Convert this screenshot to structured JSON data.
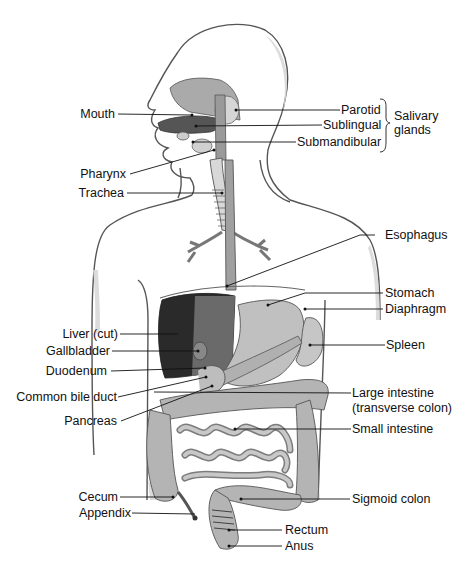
{
  "figure": {
    "type": "anatomical-diagram",
    "colors": {
      "body_outline": "#555555",
      "body_shadow": "#d4d4d4",
      "organ_fill": "#a9a9a9",
      "organ_light": "#c4c4c4",
      "organ_dark": "#6e6e6e",
      "liver_dark": "#1a1a1a",
      "leader_line": "#111111",
      "text": "#111111"
    }
  },
  "labels": {
    "left": [
      {
        "id": "mouth",
        "text": "Mouth"
      },
      {
        "id": "pharynx",
        "text": "Pharynx"
      },
      {
        "id": "trachea",
        "text": "Trachea"
      },
      {
        "id": "liver",
        "text": "Liver (cut)"
      },
      {
        "id": "gallbladder",
        "text": "Gallbladder"
      },
      {
        "id": "duodenum",
        "text": "Duodenum"
      },
      {
        "id": "common_bile_duct",
        "text": "Common bile duct"
      },
      {
        "id": "pancreas",
        "text": "Pancreas"
      },
      {
        "id": "cecum",
        "text": "Cecum"
      },
      {
        "id": "appendix",
        "text": "Appendix"
      }
    ],
    "right": [
      {
        "id": "parotid",
        "text": "Parotid"
      },
      {
        "id": "sublingual",
        "text": "Sublingual"
      },
      {
        "id": "submandibular",
        "text": "Submandibular"
      },
      {
        "id": "esophagus",
        "text": "Esophagus"
      },
      {
        "id": "stomach",
        "text": "Stomach"
      },
      {
        "id": "diaphragm",
        "text": "Diaphragm"
      },
      {
        "id": "spleen",
        "text": "Spleen"
      },
      {
        "id": "large_intestine",
        "text": "Large intestine"
      },
      {
        "id": "large_intestine_sub",
        "text": "(transverse colon)"
      },
      {
        "id": "small_intestine",
        "text": "Small intestine"
      },
      {
        "id": "sigmoid_colon",
        "text": "Sigmoid colon"
      },
      {
        "id": "rectum",
        "text": "Rectum"
      },
      {
        "id": "anus",
        "text": "Anus"
      }
    ],
    "group": {
      "salivary_line1": "Salivary",
      "salivary_line2": "glands"
    }
  }
}
